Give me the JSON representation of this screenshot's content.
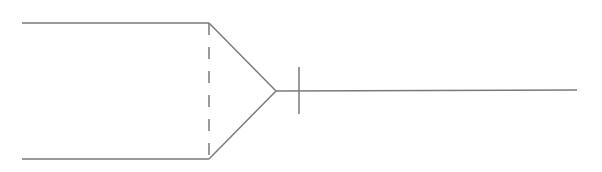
{
  "diagram": {
    "stroke_color": "#7a7a7a",
    "stroke_width": 1.5,
    "top_line": {
      "x1": 22,
      "y1": 23,
      "x2": 209,
      "y2": 23
    },
    "bottom_line": {
      "x1": 22,
      "y1": 159,
      "x2": 209,
      "y2": 159
    },
    "dashed_divider": {
      "x1": 209,
      "y1": 23,
      "x2": 209,
      "y2": 159,
      "dash": "12,12"
    },
    "upper_taper": {
      "x1": 209,
      "y1": 23,
      "x2": 276,
      "y2": 91
    },
    "lower_taper": {
      "x1": 209,
      "y1": 159,
      "x2": 276,
      "y2": 91
    },
    "output_line": {
      "x1": 276,
      "y1": 91,
      "x2": 577,
      "y2": 90
    },
    "tick_mark": {
      "x1": 299,
      "y1": 67,
      "x2": 299,
      "y2": 114
    }
  }
}
